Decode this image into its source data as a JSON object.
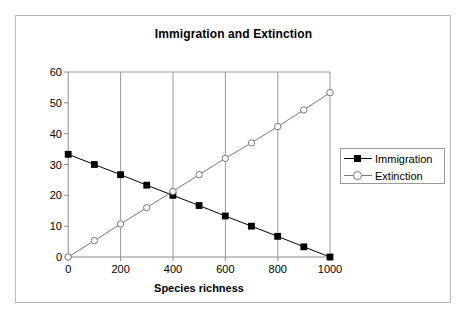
{
  "chart_data": {
    "type": "line",
    "title": "Immigration and Extinction",
    "xlabel": "Species richness",
    "ylabel": "",
    "xlim": [
      0,
      1000
    ],
    "ylim": [
      0,
      60
    ],
    "xticks": [
      0,
      200,
      400,
      600,
      800,
      1000
    ],
    "yticks": [
      0,
      10,
      20,
      30,
      40,
      50,
      60
    ],
    "xtick_labels": [
      "0",
      "200",
      "400",
      "600",
      "800",
      "1000"
    ],
    "ytick_labels": [
      "0",
      "10",
      "20",
      "30",
      "40",
      "50",
      "60"
    ],
    "grid": "vertical",
    "legend_position": "right",
    "x": [
      0,
      100,
      200,
      300,
      400,
      500,
      600,
      700,
      800,
      900,
      1000
    ],
    "series": [
      {
        "name": "Immigration",
        "marker": "filled-square",
        "color": "#000000",
        "values": [
          33.3,
          30.0,
          26.7,
          23.3,
          20.0,
          16.7,
          13.3,
          10.0,
          6.7,
          3.3,
          0.0
        ]
      },
      {
        "name": "Extinction",
        "marker": "open-circle",
        "color": "#777777",
        "values": [
          0.0,
          5.3,
          10.7,
          16.0,
          21.3,
          26.7,
          32.0,
          37.0,
          42.3,
          47.7,
          53.3
        ]
      }
    ]
  },
  "legend": {
    "entries": [
      {
        "label": "Immigration",
        "marker": "filled-square"
      },
      {
        "label": "Extinction",
        "marker": "open-circle"
      }
    ]
  },
  "colors": {
    "frame": "#b9b9b9",
    "gridline": "#808080",
    "axis": "#808080",
    "immigration": "#000000",
    "extinction": "#777777",
    "background": "#ffffff"
  }
}
